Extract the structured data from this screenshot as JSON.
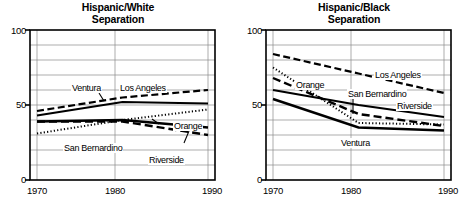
{
  "figure": {
    "width": 472,
    "height": 216,
    "background": "#ffffff",
    "ink": "#000000",
    "grid_color": "#808080"
  },
  "panels": [
    {
      "id": "hispanic-white",
      "title": "Hispanic/White\nSeparation",
      "y_ticks": [
        "100",
        "50",
        "0"
      ],
      "x_ticks": [
        "1970",
        "1980",
        "1990"
      ],
      "series_labels": [
        {
          "name": "Ventura",
          "text": "Ventura"
        },
        {
          "name": "Los Angeles",
          "text": "Los Angeles"
        },
        {
          "name": "Orange",
          "text": "Orange"
        },
        {
          "name": "San Bernardino",
          "text": "San Bernardino"
        },
        {
          "name": "Riverside",
          "text": "Riverside"
        }
      ]
    },
    {
      "id": "hispanic-black",
      "title": "Hispanic/Black\nSeparation",
      "y_ticks": [
        "100",
        "50",
        "0"
      ],
      "x_ticks": [
        "1970",
        "1980",
        "1990"
      ],
      "series_labels": [
        {
          "name": "Los Angeles",
          "text": "Los Angeles"
        },
        {
          "name": "Orange",
          "text": "Orange"
        },
        {
          "name": "San Bernardino",
          "text": "San Bernardino"
        },
        {
          "name": "Riverside",
          "text": "Riverside"
        },
        {
          "name": "Ventura",
          "text": "Ventura"
        }
      ]
    }
  ],
  "chart_data": [
    {
      "type": "line",
      "title": "Hispanic/White Separation",
      "xlabel": "",
      "ylabel": "",
      "x": [
        1970,
        1980,
        1990
      ],
      "xlim": [
        1970,
        1990
      ],
      "ylim": [
        0,
        100
      ],
      "ytick_values": [
        0,
        50,
        100
      ],
      "ygrid_step": 10,
      "xtick_values": [
        1970,
        1980,
        1990
      ],
      "grid": true,
      "legend": "inline-annotations",
      "series": [
        {
          "name": "Los Angeles",
          "values": [
            46,
            55,
            60
          ],
          "style": "dashed"
        },
        {
          "name": "Ventura",
          "values": [
            43,
            52,
            51
          ],
          "style": "solid"
        },
        {
          "name": "Orange",
          "values": [
            31,
            40,
            47
          ],
          "style": "dotted"
        },
        {
          "name": "San Bernardino",
          "values": [
            39,
            40,
            35
          ],
          "style": "solid-thick"
        },
        {
          "name": "Riverside",
          "values": [
            39,
            39,
            30
          ],
          "style": "long-dash"
        }
      ]
    },
    {
      "type": "line",
      "title": "Hispanic/Black Separation",
      "xlabel": "",
      "ylabel": "",
      "x": [
        1970,
        1980,
        1990
      ],
      "xlim": [
        1970,
        1990
      ],
      "ylim": [
        0,
        100
      ],
      "ytick_values": [
        0,
        50,
        100
      ],
      "ygrid_step": 10,
      "xtick_values": [
        1970,
        1980,
        1990
      ],
      "grid": true,
      "legend": "inline-annotations",
      "series": [
        {
          "name": "Los Angeles",
          "values": [
            84,
            71,
            58
          ],
          "style": "dashed"
        },
        {
          "name": "Orange",
          "values": [
            75,
            38,
            37
          ],
          "style": "dotted"
        },
        {
          "name": "San Bernardino",
          "values": [
            68,
            44,
            36
          ],
          "style": "long-dash"
        },
        {
          "name": "Riverside",
          "values": [
            60,
            50,
            42
          ],
          "style": "solid"
        },
        {
          "name": "Ventura",
          "values": [
            54,
            35,
            33
          ],
          "style": "solid-thick"
        }
      ]
    }
  ]
}
